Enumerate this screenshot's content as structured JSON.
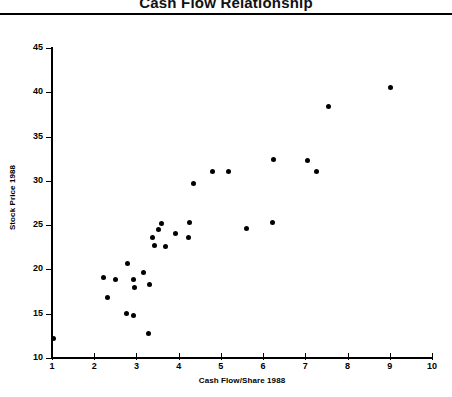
{
  "chart_data": {
    "type": "scatter",
    "title": "Cash Flow Relationship",
    "xlabel": "Cash Flow/Share 1988",
    "ylabel": "Stock Price 1988",
    "xlim": [
      1,
      10
    ],
    "ylim": [
      10,
      45
    ],
    "xticks": [
      1,
      2,
      3,
      4,
      5,
      6,
      7,
      8,
      9,
      10
    ],
    "yticks": [
      10,
      15,
      20,
      25,
      30,
      35,
      40,
      45
    ],
    "grid": false,
    "legend": null,
    "marker": "filled-circle",
    "marker_color": "#000000",
    "points": [
      {
        "x": 1.03,
        "y": 12.25
      },
      {
        "x": 2.23,
        "y": 19.05
      },
      {
        "x": 2.31,
        "y": 16.85
      },
      {
        "x": 2.51,
        "y": 18.85
      },
      {
        "x": 2.76,
        "y": 15.05
      },
      {
        "x": 2.92,
        "y": 14.8
      },
      {
        "x": 2.78,
        "y": 20.7
      },
      {
        "x": 2.92,
        "y": 18.9
      },
      {
        "x": 2.95,
        "y": 17.95
      },
      {
        "x": 3.17,
        "y": 19.7
      },
      {
        "x": 3.3,
        "y": 18.35
      },
      {
        "x": 3.28,
        "y": 12.8
      },
      {
        "x": 3.52,
        "y": 24.55
      },
      {
        "x": 3.37,
        "y": 23.65
      },
      {
        "x": 3.42,
        "y": 22.7
      },
      {
        "x": 3.6,
        "y": 25.15
      },
      {
        "x": 3.68,
        "y": 22.55
      },
      {
        "x": 3.92,
        "y": 24.05
      },
      {
        "x": 4.25,
        "y": 25.3
      },
      {
        "x": 4.23,
        "y": 23.65
      },
      {
        "x": 4.35,
        "y": 29.7
      },
      {
        "x": 4.8,
        "y": 31.1
      },
      {
        "x": 5.17,
        "y": 31.1
      },
      {
        "x": 5.6,
        "y": 24.65
      },
      {
        "x": 6.25,
        "y": 32.45
      },
      {
        "x": 6.23,
        "y": 25.35
      },
      {
        "x": 7.05,
        "y": 32.3
      },
      {
        "x": 7.27,
        "y": 31.05
      },
      {
        "x": 7.55,
        "y": 38.45
      },
      {
        "x": 9.02,
        "y": 40.55
      }
    ]
  }
}
